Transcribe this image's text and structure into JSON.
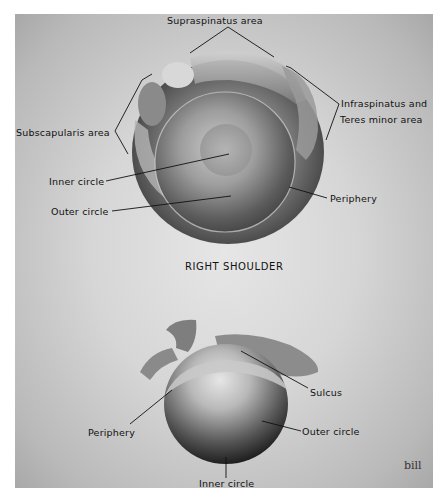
{
  "figure": {
    "title": "RIGHT SHOULDER",
    "top_view": {
      "labels": {
        "supraspinatus": "Supraspinatus  area",
        "infraspinatus_line1": "Infraspinatus  and",
        "infraspinatus_line2": "Teres minor   area",
        "subscapularis": "Subscapularis area",
        "inner_circle": "Inner circle",
        "outer_circle": "Outer circle",
        "periphery": "Periphery"
      }
    },
    "bottom_view": {
      "labels": {
        "sulcus": "Sulcus",
        "periphery": "Periphery",
        "outer_circle": "Outer circle",
        "inner_circle": "Inner circle"
      }
    },
    "signature": "bill"
  }
}
